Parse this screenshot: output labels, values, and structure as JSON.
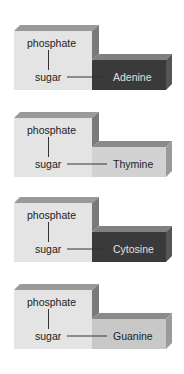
{
  "labels": {
    "phosphate": "phosphate",
    "sugar": "sugar"
  },
  "nucleotides": [
    {
      "base": "Adenine",
      "top": 20,
      "base_fill": "#3a3a3a",
      "base_top": "#808080",
      "base_side": "#555555",
      "text_color": "#e0e0e0"
    },
    {
      "base": "Thymine",
      "top": 107,
      "base_fill": "#d2d2d2",
      "base_top": "#8a8a8a",
      "base_side": "#9a9a9a",
      "text_color": "#222222"
    },
    {
      "base": "Cytosine",
      "top": 192,
      "base_fill": "#3a3a3a",
      "base_top": "#808080",
      "base_side": "#555555",
      "text_color": "#e0e0e0"
    },
    {
      "base": "Guanine",
      "top": 279,
      "base_fill": "#c8c8c8",
      "base_top": "#8a8a8a",
      "base_side": "#9a9a9a",
      "text_color": "#222222"
    }
  ],
  "colors": {
    "sugar_front": "#e4e4e4",
    "sugar_top": "#9a9a9a",
    "sugar_side": "#7a7a7a",
    "line": "#333333"
  }
}
